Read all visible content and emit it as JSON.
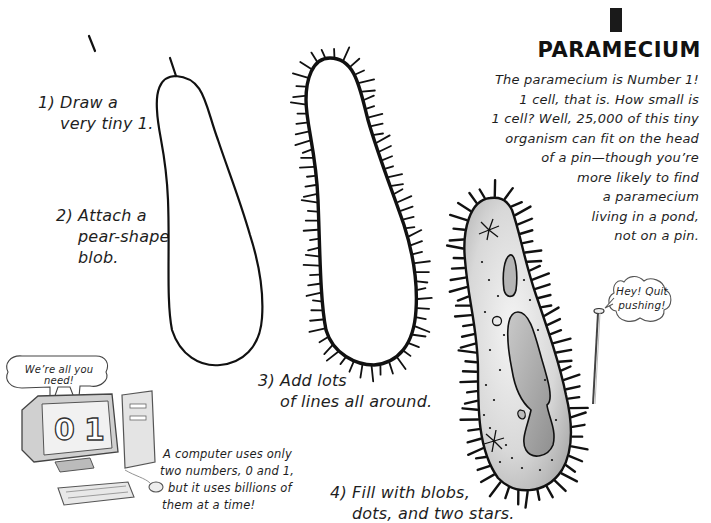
{
  "page": {
    "number_glyph": "1",
    "title": "PARAMECIUM",
    "intro_lines": [
      "The paramecium is Number 1!",
      "1 cell, that is. How small is",
      "1 cell? Well, 25,000 of this tiny",
      "organism can fit on the head",
      "of a pin—though you’re",
      "more likely to find",
      "a paramecium",
      "living in a pond,",
      "not on a pin."
    ]
  },
  "steps": [
    {
      "label": "1) Draw a",
      "line2": "very tiny 1."
    },
    {
      "label": "2) Attach a",
      "line2": "pear-shape",
      "line3": "blob."
    },
    {
      "label": "3) Add lots",
      "line2": "of lines all around."
    },
    {
      "label": "4) Fill with blobs,",
      "line2": "dots, and two stars."
    }
  ],
  "pin_bubble": {
    "line1": "Hey! Quit",
    "line2": "pushing!"
  },
  "computer": {
    "bubble": "We’re all you need!",
    "screen_digits": [
      "0",
      "1"
    ],
    "caption_lines": [
      "A computer uses only",
      "two numbers, 0 and 1,",
      "but it uses billions of",
      "them at a time!"
    ]
  },
  "illustrations": {
    "stroke_color": "#111111",
    "cell_fill_shading": "#bdbdbd"
  }
}
